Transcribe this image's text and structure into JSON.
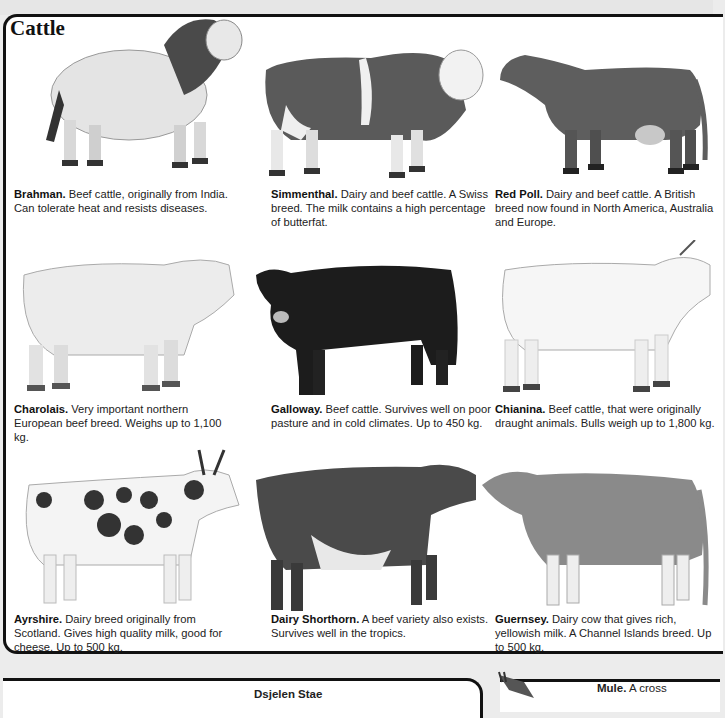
{
  "page": {
    "title": "Cattle"
  },
  "breeds": [
    {
      "name": "Brahman.",
      "text": " Beef cattle, originally from India. Can tolerate heat and resists diseases.",
      "tone": "light",
      "hump": true
    },
    {
      "name": "Simmenthal.",
      "text": " Dairy and beef cattle. A Swiss breed. The milk contains a high percentage of butterfat.",
      "tone": "piebald-dark",
      "hump": false
    },
    {
      "name": "Red Poll.",
      "text": " Dairy and beef cattle. A British breed now found in North America, Australia and Europe.",
      "tone": "dark",
      "hump": false
    },
    {
      "name": "Charolais.",
      "text": " Very important northern European beef breed. Weighs up to 1,100 kg.",
      "tone": "light",
      "hump": false
    },
    {
      "name": "Galloway.",
      "text": " Beef cattle. Survives well on poor pasture and in cold climates. Up to 450 kg.",
      "tone": "black",
      "hump": false
    },
    {
      "name": "Chianina.",
      "text": " Beef cattle, that were originally draught animals. Bulls weigh up to 1,800 kg.",
      "tone": "white",
      "hump": false
    },
    {
      "name": "Ayrshire.",
      "text": " Dairy breed originally from Scotland. Gives high quality milk, good for cheese. Up to 500 kg.",
      "tone": "spotted",
      "hump": false
    },
    {
      "name": "Dairy Shorthorn.",
      "text": " A beef variety also exists. Survives well in the tropics.",
      "tone": "dark-roan",
      "hump": false
    },
    {
      "name": "Guernsey.",
      "text": " Dairy cow that gives rich, yellowish milk. A Channel Islands breed. Up to 500 kg.",
      "tone": "mid",
      "hump": false
    }
  ],
  "lower": {
    "heading": "Dsjelen Stae",
    "mule_name": "Mule.",
    "mule_text": " A cross"
  },
  "colors": {
    "frame": "#111111",
    "text": "#222222",
    "background": "#ececec"
  }
}
